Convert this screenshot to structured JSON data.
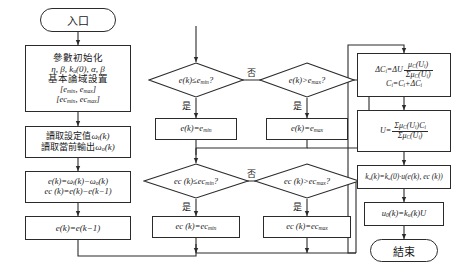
{
  "diagram": {
    "type": "flowchart",
    "stroke_color": "#2b2b2b",
    "background": "#ffffff"
  },
  "nodes": {
    "entry": {
      "shape": "terminator",
      "text": "入口"
    },
    "init": {
      "shape": "process",
      "lines": [
        "參數初始化",
        "η, β, k_u(0), α, β",
        "基本論域設置",
        "[e_min, e_max]",
        "[ec_min, ec_max]"
      ]
    },
    "read": {
      "shape": "process",
      "lines": [
        "讀取設定值ω_i(k)",
        "讀取當前輸出ω_o(k)"
      ]
    },
    "err": {
      "shape": "process",
      "lines": [
        "e(k)=ω_i(k)−ω_o(k)",
        "ec (k)=e(k)−e(k−1)"
      ]
    },
    "shift": {
      "shape": "process",
      "lines": [
        "e(k)=e(k−1)"
      ]
    },
    "dec_emin": {
      "shape": "decision",
      "text": "e(k)≤e_min?"
    },
    "dec_emax": {
      "shape": "decision",
      "text": "e(k)>e_max?"
    },
    "set_emin": {
      "shape": "process",
      "lines": [
        "e(k)=e_min"
      ]
    },
    "set_emax": {
      "shape": "process",
      "lines": [
        "e(k)=e_max"
      ]
    },
    "dec_ecmin": {
      "shape": "decision",
      "text": "ec (k)≤ec_min?"
    },
    "dec_ecmax": {
      "shape": "decision",
      "text": "ec (k)>ec_max?"
    },
    "set_ecmin": {
      "shape": "process",
      "lines": [
        "ec (k)=ec_min"
      ]
    },
    "set_ecmax": {
      "shape": "process",
      "lines": [
        "ec (k)=ec_max"
      ]
    },
    "delta_c": {
      "shape": "process",
      "lines": [
        "ΔC_i=ΔU · μ_C(U_i)/Σμ_C(U_i)",
        "C_i=C_i+ΔC_i"
      ]
    },
    "defuzz": {
      "shape": "process",
      "lines": [
        "U = Σμ_C(U_i)C_i / Σμ_C(U_i)"
      ]
    },
    "gain": {
      "shape": "process",
      "lines": [
        "k_u(k)=k_u(0)·u(e(k), ec (k))"
      ]
    },
    "output": {
      "shape": "process",
      "lines": [
        "u_0(k)=k_u(k)U"
      ]
    },
    "end": {
      "shape": "terminator",
      "text": "結束"
    }
  },
  "edge_labels": {
    "no_1": "否",
    "yes_emin": "是",
    "yes_emax": "是",
    "no_2": "否",
    "yes_ecmin": "是",
    "yes_ecmax": "是"
  },
  "symbols": {
    "eta": "η",
    "beta": "β",
    "alpha": "α",
    "omega": "ω",
    "mu": "μ",
    "sigma": "Σ",
    "delta": "Δ",
    "le": "≤",
    "gt": ">",
    "minus": "−"
  }
}
